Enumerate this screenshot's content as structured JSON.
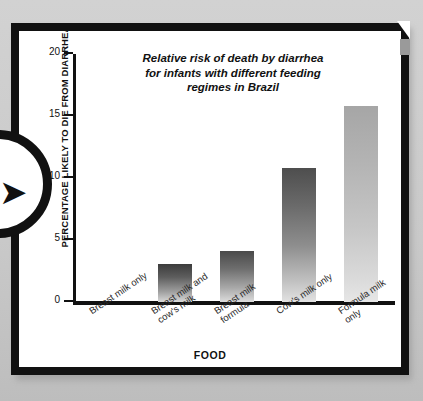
{
  "page": {
    "background_color": "#cfcfcf",
    "frame_color": "#111111",
    "panel_color": "#ffffff"
  },
  "decorations": {
    "nav_badge": {
      "icon": "arrow-right-icon",
      "glyph": "➤"
    },
    "corner_notch": {
      "name": "corner-notch"
    }
  },
  "chart_data": {
    "type": "bar",
    "title": "Relative risk of death by diarrhea for infants with different feeding regimes in Brazil",
    "title_lines": [
      "Relative risk of death by diarrhea",
      "for infants with different feeding",
      "regimes in Brazil"
    ],
    "xlabel": "FOOD",
    "ylabel": "PERCENTAGE LIKELY TO DIE FROM DIARRHEA",
    "categories": [
      "Breast milk only",
      "Breast milk and cow's milk",
      "Breast milk formula",
      "Cow's milk only",
      "Formula milk only"
    ],
    "category_lines": [
      "Breast milk only",
      "Breast milk and\ncow's milk",
      "Breast milk\nformula",
      "Cow's milk only",
      "Formula milk\nonly"
    ],
    "values": [
      0,
      3.1,
      4.1,
      10.8,
      15.8
    ],
    "ylim": [
      0,
      20
    ],
    "yticks": [
      0,
      5,
      10,
      15,
      20
    ],
    "ytick_labels": [
      "0",
      "5",
      "10",
      "15",
      "20"
    ],
    "grid": false,
    "legend": false,
    "bar_tones": [
      "none",
      "dark",
      "mid",
      "deep",
      "light"
    ]
  }
}
